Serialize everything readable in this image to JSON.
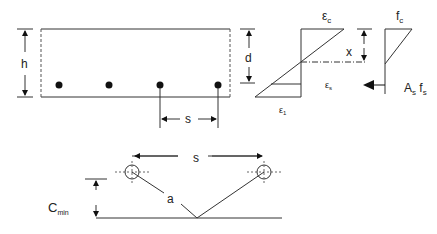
{
  "diagram": {
    "section": {
      "height_label": "h",
      "spacing_label": "s",
      "bar_count": 4
    },
    "strain": {
      "depth_label": "d",
      "top_strain_label": "ε",
      "top_strain_sub": "c",
      "steel_strain_label": "ε",
      "steel_strain_sub": "s",
      "bottom_strain_label": "ε",
      "bottom_strain_sub": "1"
    },
    "stress": {
      "neutral_axis_label": "x",
      "concrete_stress_label": "f",
      "concrete_stress_sub": "c",
      "steel_force_label_a": "A",
      "steel_force_sub_a": "s",
      "steel_force_label_f": " f",
      "steel_force_sub_f": "s"
    },
    "cover": {
      "spacing_label": "s",
      "distance_label": "a",
      "cover_label": "C",
      "cover_sub": "min"
    }
  }
}
